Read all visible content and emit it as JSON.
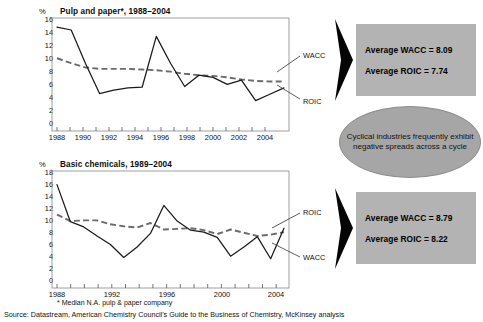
{
  "figure": {
    "footnote": "* Median N.A. pulp & paper company",
    "source": "Source: Datastream, American Chemistry Council's Guide to the Business of Chemistry, McKinsey analysis"
  },
  "callouts": {
    "top": {
      "line1": "Average WACC = 8.09",
      "line2": "Average ROIC = 7.74"
    },
    "bottom": {
      "line1": "Average WACC = 8.79",
      "line2": "Average ROIC = 8.22"
    },
    "ellipse": {
      "text": "Cyclical industries frequently exhibit negative spreads across a cycle"
    }
  },
  "chart_data": [
    {
      "type": "line",
      "title": "Pulp and paper*, 1988–2004",
      "ylabel": "%",
      "xlabel": "",
      "ylim": [
        0,
        16
      ],
      "yticks": [
        0,
        2,
        4,
        6,
        8,
        10,
        12,
        14,
        16
      ],
      "xlim": [
        1988,
        2004
      ],
      "xticks": [
        1988,
        1990,
        1992,
        1994,
        1996,
        1998,
        2000,
        2002,
        2004
      ],
      "x": [
        1988,
        1989,
        1990,
        1991,
        1992,
        1993,
        1994,
        1995,
        1996,
        1997,
        1998,
        1999,
        2000,
        2001,
        2002,
        2003,
        2004
      ],
      "grid": false,
      "legend": "inline-right",
      "series": [
        {
          "name": "ROIC",
          "style": "solid",
          "color": "#1a1a1a",
          "values": [
            14.7,
            14.3,
            9.6,
            5.3,
            5.8,
            6.1,
            6.2,
            13.4,
            9.6,
            6.3,
            7.9,
            7.6,
            6.6,
            7.2,
            4.3,
            5.2,
            6.1
          ]
        },
        {
          "name": "WACC",
          "style": "dashed",
          "color": "#6b6b6b",
          "values": [
            10.3,
            9.6,
            9.0,
            8.8,
            8.8,
            8.8,
            8.7,
            8.6,
            8.4,
            8.1,
            7.9,
            7.8,
            7.6,
            7.3,
            7.1,
            7.0,
            7.0
          ]
        }
      ]
    },
    {
      "type": "line",
      "title": "Basic chemicals, 1989–2004",
      "ylabel": "%",
      "xlabel": "",
      "ylim": [
        0,
        18
      ],
      "yticks": [
        0,
        2,
        4,
        6,
        8,
        10,
        12,
        14,
        16,
        18
      ],
      "xlim": [
        1988,
        2005
      ],
      "xticks": [
        1988,
        1992,
        1996,
        2000,
        2004
      ],
      "x": [
        1988,
        1989,
        1990,
        1991,
        1992,
        1993,
        1994,
        1995,
        1996,
        1997,
        1998,
        1999,
        2000,
        2001,
        2002,
        2003,
        2004,
        2005
      ],
      "grid": false,
      "legend": "inline-right",
      "series": [
        {
          "name": "ROIC",
          "style": "solid",
          "color": "#1a1a1a",
          "values": [
            15.9,
            10.2,
            9.4,
            8.0,
            6.7,
            4.7,
            6.3,
            8.4,
            12.7,
            10.3,
            8.9,
            8.6,
            7.8,
            4.9,
            6.3,
            7.9,
            4.5,
            9.2
          ]
        },
        {
          "name": "WACC",
          "style": "dashed",
          "color": "#6b6b6b",
          "values": [
            11.3,
            10.3,
            10.4,
            10.4,
            9.8,
            9.5,
            9.3,
            10.0,
            9.0,
            9.1,
            9.2,
            8.9,
            8.3,
            9.0,
            8.5,
            8.0,
            8.2,
            8.6
          ]
        }
      ]
    }
  ],
  "chart1_labels": {
    "wacc": "WACC",
    "roic": "ROIC"
  },
  "chart2_labels": {
    "roic": "ROIC",
    "wacc": "WACC"
  },
  "axis1": {
    "ylabel": "%",
    "yticks": [
      "16",
      "14",
      "12",
      "10",
      "8",
      "6",
      "4",
      "2",
      "0"
    ],
    "xticks": [
      "1988",
      "1990",
      "1992",
      "1994",
      "1996",
      "1998",
      "2000",
      "2002",
      "2004"
    ]
  },
  "axis2": {
    "ylabel": "%",
    "yticks": [
      "18",
      "16",
      "14",
      "12",
      "10",
      "8",
      "6",
      "4",
      "2",
      "0"
    ],
    "xticks": [
      "1988",
      "1992",
      "1996",
      "2000",
      "2004"
    ]
  },
  "colors": {
    "callout_bg": "#b3b3b3",
    "ellipse_bg": "#a6a6a6",
    "arrow": "#000000",
    "roic_line": "#1a1a1a",
    "wacc_line": "#6b6b6b",
    "axis": "#555555"
  }
}
